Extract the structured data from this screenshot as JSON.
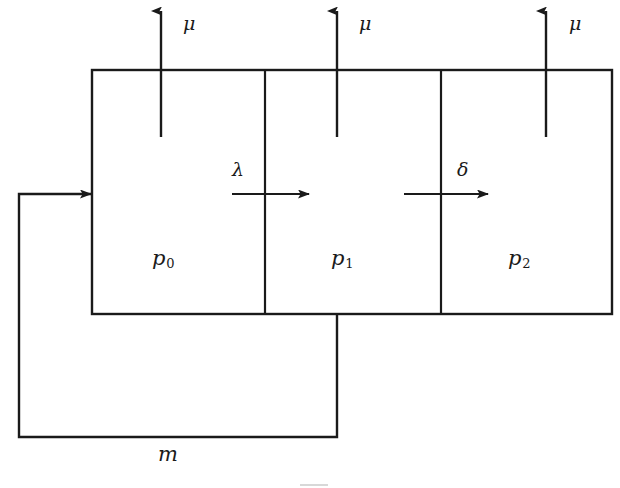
{
  "diagram": {
    "type": "queueing-network-block-diagram",
    "stroke_color": "#1a1a1a",
    "background_color": "#ffffff",
    "service_rate_labels": [
      {
        "name": "mu-label-0",
        "text": "μ",
        "x": 183,
        "y": 14
      },
      {
        "name": "mu-label-1",
        "text": "μ",
        "x": 359,
        "y": 14
      },
      {
        "name": "mu-label-2",
        "text": "μ",
        "x": 569,
        "y": 14
      }
    ],
    "transition_labels": [
      {
        "name": "lambda-label",
        "text": "λ",
        "x": 232,
        "y": 160
      },
      {
        "name": "delta-label",
        "text": "δ",
        "x": 457,
        "y": 160
      }
    ],
    "state_labels": [
      {
        "name": "state-label-p0",
        "base": "p",
        "sub": "0",
        "x": 152,
        "y": 248
      },
      {
        "name": "state-label-p1",
        "base": "p",
        "sub": "1",
        "x": 331,
        "y": 248
      },
      {
        "name": "state-label-p2",
        "base": "p",
        "sub": "2",
        "x": 508,
        "y": 248
      }
    ],
    "feedback_label": {
      "name": "feedback-label-m",
      "text": "m",
      "x": 158,
      "y": 444
    }
  },
  "geometry": {
    "box": {
      "left": 92,
      "top": 70,
      "right": 612,
      "bottom": 314
    },
    "dividers": [
      265,
      441
    ],
    "mu_arrows": [
      {
        "x": 161,
        "y_tail": 137,
        "y_tip": 9
      },
      {
        "x": 337,
        "y_tail": 137,
        "y_tip": 9
      },
      {
        "x": 546,
        "y_tail": 137,
        "y_tip": 9
      }
    ],
    "flow_arrows": [
      {
        "name": "lambda-arrow",
        "x_tail": 232,
        "x_tip": 311,
        "y": 194
      },
      {
        "name": "delta-arrow",
        "x_tail": 404,
        "x_tip": 489,
        "y": 194
      }
    ],
    "feedback_path": {
      "entry_arrow": {
        "x_tail": 19,
        "x_tip": 93,
        "y": 194
      },
      "left_x": 19,
      "bottom_y": 437,
      "right_x": 337,
      "top_y": 315
    }
  }
}
